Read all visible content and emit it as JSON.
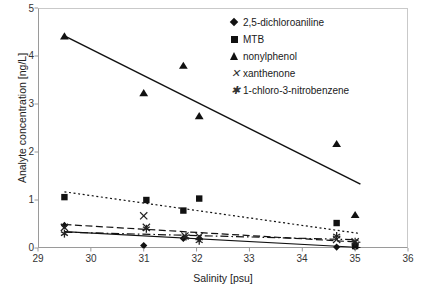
{
  "chart_data": {
    "type": "scatter",
    "title": "",
    "xlabel": "Salinity [psu]",
    "ylabel": "Analyte concentration [ng/L]",
    "xlim": [
      29,
      36
    ],
    "ylim": [
      0,
      5
    ],
    "xticks": [
      "29",
      "30",
      "31",
      "32",
      "33",
      "34",
      "35",
      "36"
    ],
    "yticks": [
      "0",
      "1",
      "2",
      "3",
      "4",
      "5"
    ],
    "grid": false,
    "legend_position": "top-right",
    "series": [
      {
        "name": "2,5-dichloroaniline",
        "marker": "diamond",
        "line_style": "solid",
        "points": [
          {
            "x": 29.5,
            "y": 0.47
          },
          {
            "x": 31.0,
            "y": 0.05
          },
          {
            "x": 31.75,
            "y": 0.2
          },
          {
            "x": 32.05,
            "y": 0.2
          },
          {
            "x": 34.65,
            "y": 0.02
          },
          {
            "x": 35.0,
            "y": 0.02
          }
        ],
        "trend": [
          {
            "x": 29.5,
            "y": 0.34
          },
          {
            "x": 35.1,
            "y": 0.01
          }
        ]
      },
      {
        "name": "MTB",
        "marker": "square",
        "line_style": "dotted",
        "points": [
          {
            "x": 29.5,
            "y": 1.06
          },
          {
            "x": 31.05,
            "y": 1.0
          },
          {
            "x": 31.75,
            "y": 0.78
          },
          {
            "x": 32.05,
            "y": 1.03
          },
          {
            "x": 34.65,
            "y": 0.52
          },
          {
            "x": 35.0,
            "y": 0.04
          }
        ],
        "trend": [
          {
            "x": 29.5,
            "y": 1.17
          },
          {
            "x": 35.1,
            "y": 0.3
          }
        ]
      },
      {
        "name": "nonylphenol",
        "marker": "triangle",
        "line_style": "solid",
        "points": [
          {
            "x": 29.5,
            "y": 4.41
          },
          {
            "x": 31.0,
            "y": 3.23
          },
          {
            "x": 31.75,
            "y": 3.8
          },
          {
            "x": 32.05,
            "y": 2.75
          },
          {
            "x": 34.65,
            "y": 2.17
          },
          {
            "x": 35.0,
            "y": 0.69
          }
        ],
        "trend": [
          {
            "x": 29.5,
            "y": 4.42
          },
          {
            "x": 35.1,
            "y": 1.33
          }
        ]
      },
      {
        "name": "xanthenone",
        "marker": "x",
        "line_style": "dashed",
        "points": [
          {
            "x": 29.5,
            "y": 0.43
          },
          {
            "x": 31.0,
            "y": 0.67
          },
          {
            "x": 31.05,
            "y": 0.43
          },
          {
            "x": 31.78,
            "y": 0.25
          },
          {
            "x": 32.05,
            "y": 0.24
          },
          {
            "x": 34.65,
            "y": 0.18
          },
          {
            "x": 35.0,
            "y": 0.13
          }
        ],
        "trend": [
          {
            "x": 29.5,
            "y": 0.49
          },
          {
            "x": 35.1,
            "y": 0.12
          }
        ]
      },
      {
        "name": "1-chloro-3-nitrobenzene",
        "marker": "star",
        "line_style": "dash-dot",
        "points": [
          {
            "x": 29.5,
            "y": 0.3
          },
          {
            "x": 31.05,
            "y": 0.4
          },
          {
            "x": 31.8,
            "y": 0.24
          },
          {
            "x": 32.05,
            "y": 0.15
          },
          {
            "x": 34.65,
            "y": 0.25
          },
          {
            "x": 35.0,
            "y": 0.13
          }
        ],
        "trend": [
          {
            "x": 29.5,
            "y": 0.33
          },
          {
            "x": 35.1,
            "y": 0.17
          }
        ]
      }
    ]
  },
  "legend": {
    "items": [
      {
        "label": "2,5-dichloroaniline",
        "marker": "diamond-marker"
      },
      {
        "label": "MTB",
        "marker": "square-marker"
      },
      {
        "label": "nonylphenol",
        "marker": "triangle-marker"
      },
      {
        "label": "xanthenone",
        "marker": "x-marker"
      },
      {
        "label": "1-chloro-3-nitrobenzene",
        "marker": "star-marker"
      }
    ]
  },
  "axes": {
    "x_title": "Salinity [psu]",
    "y_title": "Analyte concentration [ng/L]",
    "x_ticks": [
      "29",
      "30",
      "31",
      "32",
      "33",
      "34",
      "35",
      "36"
    ],
    "y_ticks": [
      "5",
      "4",
      "3",
      "2",
      "1",
      "0"
    ]
  },
  "caption": ""
}
